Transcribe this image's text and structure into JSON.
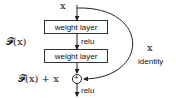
{
  "diagram": {
    "input_label": "x",
    "layers": [
      {
        "label": "weight layer"
      },
      {
        "label": "weight layer"
      }
    ],
    "activation_between": "relu",
    "activation_output": "relu",
    "function_label": "𝓕(x)",
    "sum_label": "𝓕(x) + x",
    "shortcut_label": "x",
    "shortcut_caption": "identity",
    "sum_symbol": "+"
  }
}
